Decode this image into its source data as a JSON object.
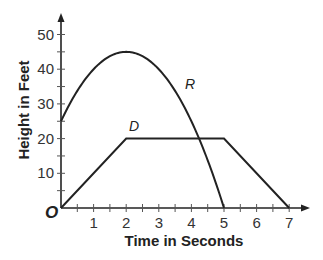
{
  "chart_data": {
    "type": "line",
    "title": "",
    "xlabel": "Time in Seconds",
    "ylabel": "Height in Feet",
    "origin_label": "O",
    "xlim": [
      0,
      7.5
    ],
    "ylim": [
      0,
      55
    ],
    "x_ticks": [
      1,
      2,
      3,
      4,
      5,
      6,
      7
    ],
    "x_minor_ticks": [
      0.5,
      1.5,
      2.5,
      3.5,
      4.5,
      5.5,
      6.5
    ],
    "y_ticks": [
      10,
      20,
      30,
      40,
      50
    ],
    "y_minor_ticks": [
      5,
      15,
      25,
      35,
      45
    ],
    "grid": false,
    "legend": "inline labels",
    "series": [
      {
        "name": "R",
        "kind": "parabola",
        "equation": "h = -5t^2 + 20t + 25",
        "x": [
          0,
          0.5,
          1,
          1.5,
          2,
          2.5,
          3,
          3.5,
          4,
          4.5,
          5
        ],
        "values": [
          25,
          33.75,
          40,
          43.75,
          45,
          43.75,
          40,
          33.75,
          25,
          13.75,
          0
        ],
        "label_position": [
          3.8,
          39
        ]
      },
      {
        "name": "D",
        "kind": "piecewise linear",
        "x": [
          0,
          2,
          5,
          7
        ],
        "values": [
          0,
          20,
          20,
          0
        ],
        "label_position": [
          2.2,
          22
        ]
      }
    ]
  },
  "labels": {
    "x_axis_title": "Time in Seconds",
    "y_axis_title": "Height in Feet",
    "origin": "O",
    "x_ticks": [
      "1",
      "2",
      "3",
      "4",
      "5",
      "6",
      "7"
    ],
    "y_ticks": [
      "10",
      "20",
      "30",
      "40",
      "50"
    ],
    "series_R": "R",
    "series_D": "D"
  }
}
